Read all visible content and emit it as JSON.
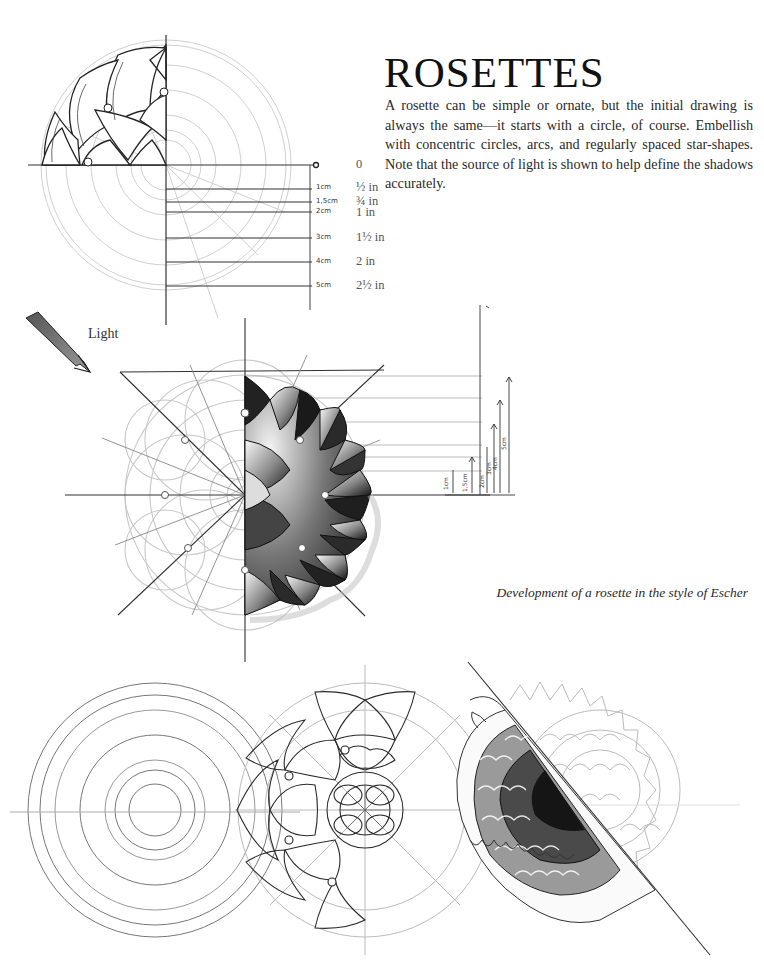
{
  "page": {
    "title": "ROSETTES",
    "intro": "A rosette can be simple or ornate, but the initial drawing is always the same—it starts with a circle, of course. Embellish with concentric circles, arcs, and regularly spaced star-shapes. Note that the source of light is shown to help define the shadows accurately.",
    "caption": "Development of a rosette in the style of Escher"
  },
  "scale_diagram": {
    "ticks": [
      {
        "cm": "",
        "inch": "0",
        "end_marker": "o"
      },
      {
        "cm": "1cm",
        "inch": "½ in"
      },
      {
        "cm": "1,5cm",
        "inch": "¾ in"
      },
      {
        "cm": "2cm",
        "inch": "1 in"
      },
      {
        "cm": "3cm",
        "inch": "1½ in"
      },
      {
        "cm": "4cm",
        "inch": "2 in"
      },
      {
        "cm": "5cm",
        "inch": "2½ in"
      }
    ]
  },
  "light": {
    "label": "Light",
    "icon": "light-direction-arrow-icon"
  },
  "side_measurements": [
    "1cm",
    "1,5cm",
    "2cm",
    "3cm",
    "4cm",
    "5cm"
  ],
  "illustrations": [
    "quarter-rosette-with-scale",
    "half-shaded-escher-rosette",
    "concentric-circles-construction",
    "ornate-rosette-outline",
    "shaded-chrysanthemum-rosette"
  ]
}
